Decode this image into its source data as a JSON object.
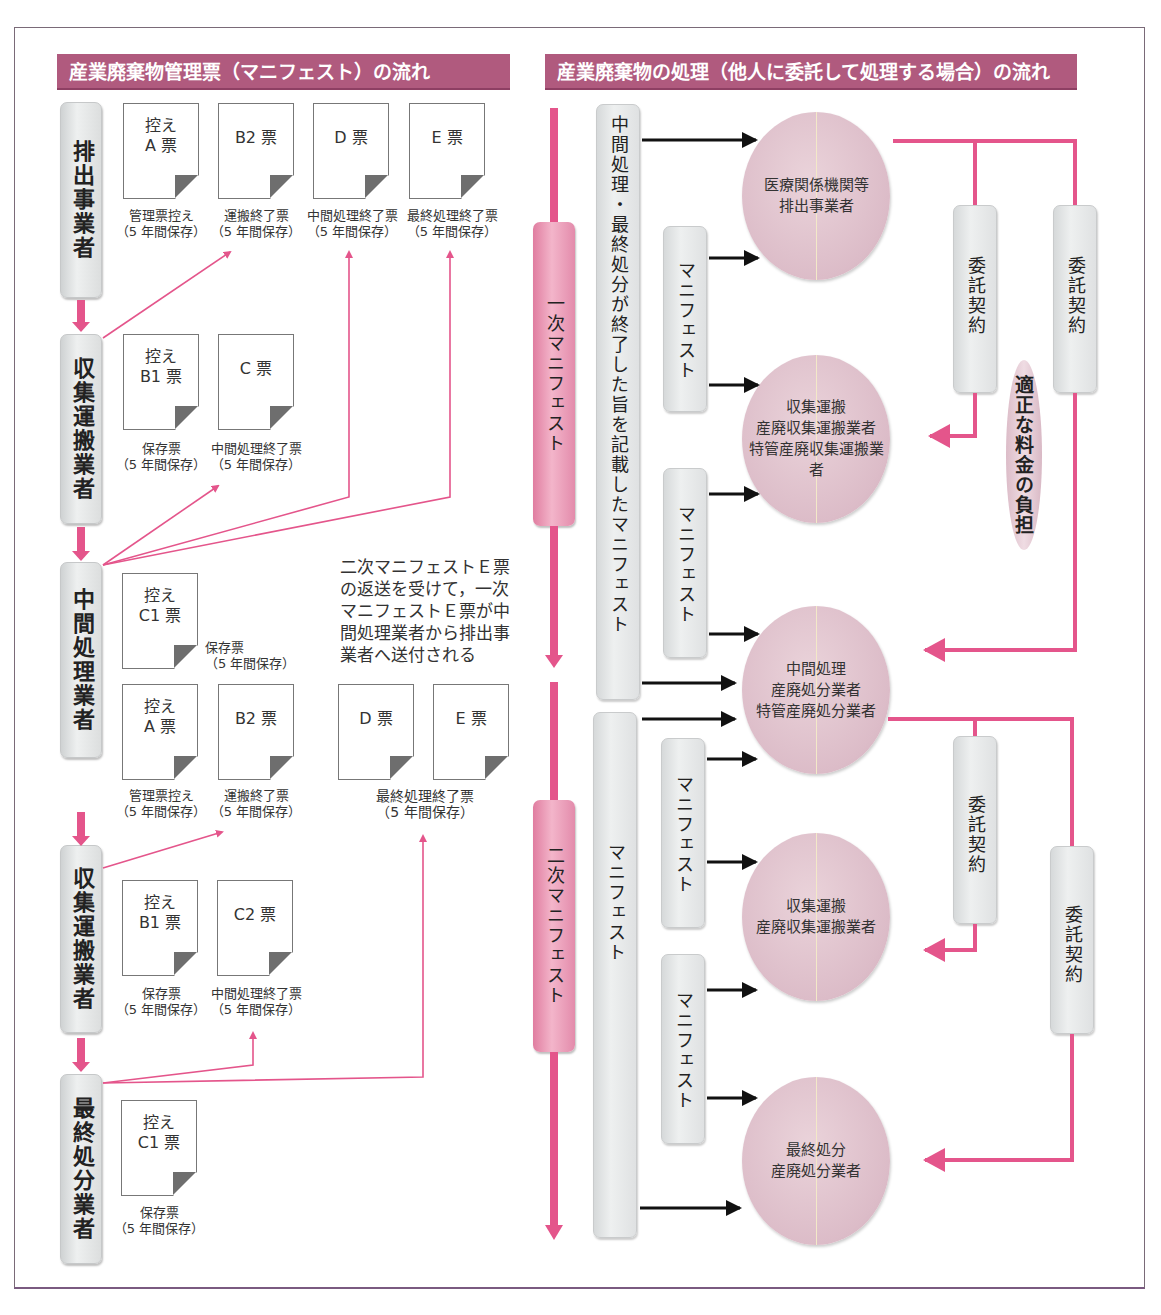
{
  "left_panel": {
    "title": "産業廃棄物管理票（マニフェスト）の流れ",
    "actors": [
      {
        "id": "emitter",
        "label": "排出事業者"
      },
      {
        "id": "collector1",
        "label": "収集運搬業者"
      },
      {
        "id": "intermediate",
        "label": "中間処理業者"
      },
      {
        "id": "collector2",
        "label": "収集運搬業者"
      },
      {
        "id": "final",
        "label": "最終処分業者"
      }
    ],
    "documents": {
      "emitter": [
        {
          "label": "控え\nA 票",
          "caption": "管理票控え\n（5 年間保存）"
        },
        {
          "label": "B2 票",
          "caption": "運搬終了票\n（5 年間保存）"
        },
        {
          "label": "D 票",
          "caption": "中間処理終了票\n（5 年間保存）"
        },
        {
          "label": "E 票",
          "caption": "最終処理終了票\n（5 年間保存）"
        }
      ],
      "collector1": [
        {
          "label": "控え\nB1 票",
          "caption": "保存票\n（5 年間保存）"
        },
        {
          "label": "C 票",
          "caption": "中間処理終了票\n（5 年間保存）"
        }
      ],
      "intermediate_top": [
        {
          "label": "控え\nC1 票",
          "caption": "保存票\n（5 年間保存）"
        }
      ],
      "intermediate_bottom": [
        {
          "label": "控え\nA 票",
          "caption": "管理票控え\n（5 年間保存）"
        },
        {
          "label": "B2 票",
          "caption": "運搬終了票\n（5 年間保存）"
        },
        {
          "label": "D 票"
        },
        {
          "label": "E 票"
        }
      ],
      "intermediate_de_caption": "最終処理終了票\n（5 年間保存）",
      "collector2": [
        {
          "label": "控え\nB1 票",
          "caption": "保存票\n（5 年間保存）"
        },
        {
          "label": "C2 票",
          "caption": "中間処理終了票\n（5 年間保存）"
        }
      ],
      "final": [
        {
          "label": "控え\nC1 票",
          "caption": "保存票\n（5 年間保存）"
        }
      ]
    },
    "note": "二次マニフェストＥ票\nの返送を受けて，一次\nマニフェストＥ票が中\n間処理業者から排出事\n業者へ送付される"
  },
  "right_panel": {
    "title": "産業廃棄物の処理（他人に委託して処理する場合）の流れ",
    "primary_manifest": "一次マニフェスト",
    "secondary_manifest": "二次マニフェスト",
    "long_bar_top": "中間処理・最終処分が終了した旨を記載したマニフェスト",
    "long_bar_bottom": "マニフェスト",
    "manifest_label": "マニフェスト",
    "contract_label": "委託契約",
    "fee_label": "適正な料金の負担",
    "circles": [
      {
        "id": "emitter",
        "text": "医療関係機関等\n排出事業者"
      },
      {
        "id": "collector1",
        "text": "収集運搬\n産廃収集運搬業者\n特管産廃収集運搬業者"
      },
      {
        "id": "intermediate",
        "text": "中間処理\n産廃処分業者\n特管産廃処分業者"
      },
      {
        "id": "collector2",
        "text": "収集運搬\n産廃収集運搬業者"
      },
      {
        "id": "final",
        "text": "最終処分\n産廃処分業者"
      }
    ]
  },
  "colors": {
    "title_bar": "#b05a7e",
    "arrow_pink": "#e4558b",
    "circle_pink": "#e3c6d0",
    "box_grey": "#e6e8e9"
  }
}
